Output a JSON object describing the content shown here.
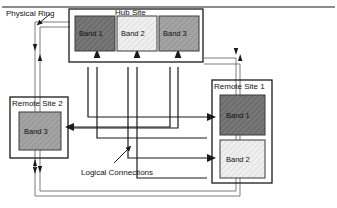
{
  "diagram": {
    "title_label": "Physical Ring",
    "annotation_label": "Logical Connections",
    "colors": {
      "band1_fill": "#6e6e6e",
      "band2_fill": "#ededed",
      "band3_fill": "#9c9c9c",
      "site_fill": "#ffffff",
      "stroke": "#1a1a1a",
      "background": "#ffffff"
    },
    "sites": [
      {
        "id": "hub",
        "label": "Hub Site",
        "bands": [
          {
            "label": "Band 1",
            "shade": "dark"
          },
          {
            "label": "Band 2",
            "shade": "light"
          },
          {
            "label": "Band 3",
            "shade": "medium"
          }
        ]
      },
      {
        "id": "remote1",
        "label": "Remote Site 1",
        "bands": [
          {
            "label": "Band 1",
            "shade": "dark"
          },
          {
            "label": "Band 2",
            "shade": "light"
          }
        ]
      },
      {
        "id": "remote2",
        "label": "Remote Site 2",
        "bands": [
          {
            "label": "Band 3",
            "shade": "medium"
          }
        ]
      }
    ],
    "logical_connections": [
      {
        "from": "remote1.Band 1",
        "to": "hub.Band 1"
      },
      {
        "from": "remote1.Band 2",
        "to": "hub.Band 2"
      },
      {
        "from": "remote2.Band 3",
        "to": "hub.Band 3"
      },
      {
        "from": "hub.Band 1",
        "to": "remote1.Band 1"
      },
      {
        "from": "hub.Band 2",
        "to": "remote1.Band 2"
      },
      {
        "from": "hub.Band 3",
        "to": "remote2.Band 3"
      }
    ],
    "physical_ring": {
      "description": "bidirectional counter-rotating ring linking Hub Site, Remote Site 1 and Remote Site 2",
      "direction_count": 2
    }
  }
}
